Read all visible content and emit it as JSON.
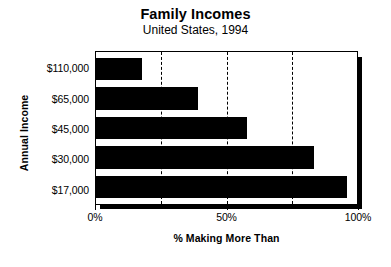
{
  "chart_data": {
    "type": "bar",
    "orientation": "horizontal",
    "title": "Family Incomes",
    "subtitle": "United States, 1994",
    "xlabel": "% Making More Than",
    "ylabel": "Annual Income",
    "categories": [
      "$110,000",
      "$65,000",
      "$45,000",
      "$30,000",
      "$17,000"
    ],
    "values": [
      17.5,
      39,
      58,
      83.5,
      96
    ],
    "xlim": [
      0,
      100
    ],
    "xticks": [
      0,
      50,
      100
    ],
    "xtick_labels": [
      "0%",
      "50%",
      "100%"
    ],
    "gridlines": [
      25,
      50,
      75
    ],
    "grid": true,
    "grid_style": "dashed",
    "legend": null,
    "bar_color": "#000000",
    "background_color": "#ffffff"
  }
}
